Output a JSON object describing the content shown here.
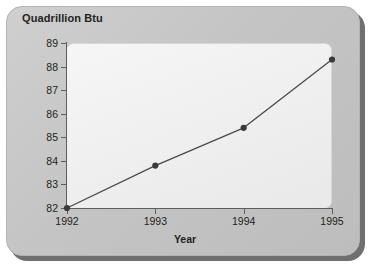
{
  "chart_data": {
    "type": "line",
    "title": "",
    "ylabel": "Quadrillion Btu",
    "xlabel": "Year",
    "categories": [
      "1992",
      "1993",
      "1994",
      "1995"
    ],
    "x": [
      1992,
      1993,
      1994,
      1995
    ],
    "values": [
      82.0,
      83.8,
      85.4,
      88.3
    ],
    "series": [
      {
        "name": "Quadrillion Btu",
        "values": [
          82.0,
          83.8,
          85.4,
          88.3
        ]
      }
    ],
    "ylim": [
      82,
      89
    ],
    "xlim": [
      1992,
      1995
    ],
    "ytick_labels": [
      "89",
      "88",
      "87",
      "86",
      "85",
      "84",
      "83",
      "82"
    ],
    "ytick_values": [
      89,
      88,
      87,
      86,
      85,
      84,
      83,
      82
    ],
    "xtick_labels": [
      "1992",
      "1993",
      "1994",
      "1995"
    ],
    "grid": false,
    "legend": false,
    "marker": "filled-circle",
    "line_color": "#4a4a4a",
    "marker_color": "#3a3a3a",
    "plot_background": "#f0f0f0",
    "panel_background": "#c8c8c8"
  }
}
